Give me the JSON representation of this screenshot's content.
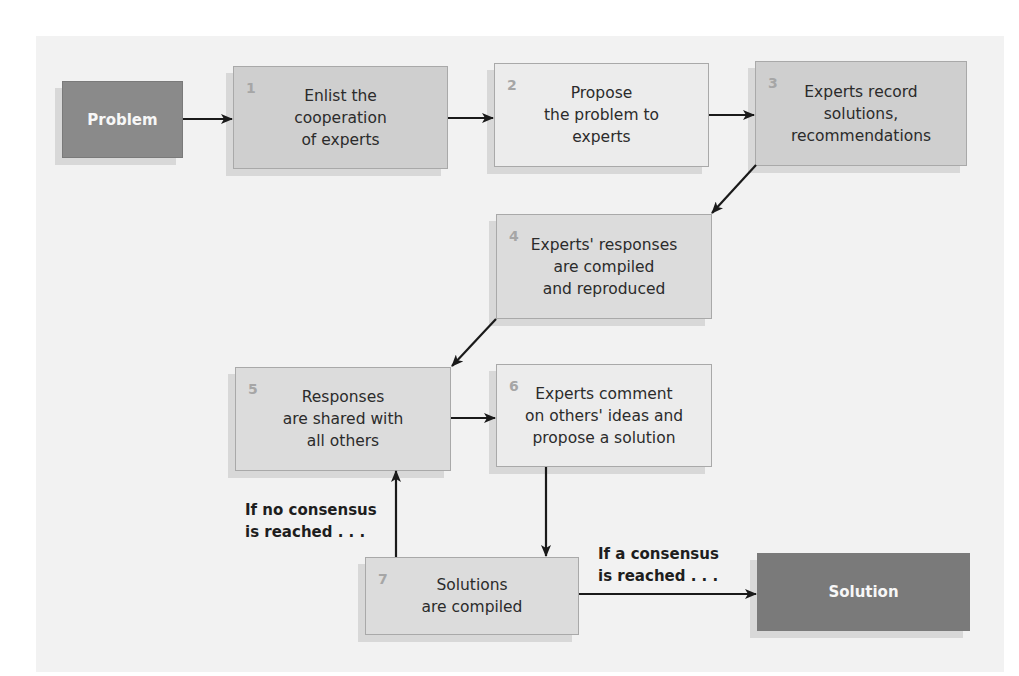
{
  "diagram": {
    "start": {
      "label": "Problem"
    },
    "end": {
      "label": "Solution"
    },
    "steps": [
      {
        "number": "1",
        "text": "Enlist the\ncooperation\nof experts"
      },
      {
        "number": "2",
        "text": "Propose\nthe problem to\nexperts"
      },
      {
        "number": "3",
        "text": "Experts record\nsolutions,\nrecommendations"
      },
      {
        "number": "4",
        "text": "Experts' responses\nare compiled\nand reproduced"
      },
      {
        "number": "5",
        "text": "Responses\nare shared with\nall others"
      },
      {
        "number": "6",
        "text": "Experts comment\non others' ideas and\npropose a solution"
      },
      {
        "number": "7",
        "text": "Solutions\nare compiled"
      }
    ],
    "conditions": {
      "no_consensus": "If no consensus\nis reached . . .",
      "consensus": "If a consensus\nis reached . . ."
    },
    "colors": {
      "panel_bg": "#f2f2f2",
      "endpoint_dark": "#7a7a7a",
      "endpoint_medium": "#8a8a8a",
      "step_medium": "#cfcfcf",
      "step_light": "#ececec",
      "arrow": "#1a1a1a"
    }
  }
}
